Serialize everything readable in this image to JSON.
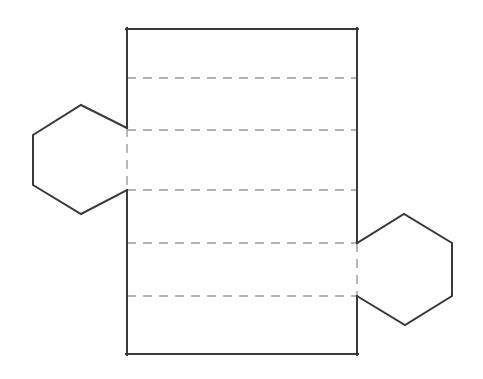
{
  "figure": {
    "title": "Net of a hexagonal prism",
    "description": "Geometric net diagram: a tall rectangle divided into six horizontal bands by five dashed fold lines, with a regular hexagon attached to the left edge and a congruent hexagon attached to the right edge.",
    "canvas": {
      "width": 483,
      "height": 379,
      "background": "#ffffff"
    },
    "colors": {
      "solid_edge": "#3a3a3a",
      "fold_line": "#9a9a9a",
      "face_fill": "#ffffff"
    },
    "stroke_widths": {
      "solid_edge": 2,
      "fold_line": 1.4
    },
    "fold_dash_pattern": "9 7"
  },
  "chart_data": {
    "type": "diagram",
    "title": "Net of a hexagonal prism",
    "shapes": [
      {
        "name": "lateral-surface-rectangle",
        "kind": "rectangle",
        "x": 127,
        "y": 29,
        "width": 230,
        "height": 325,
        "x_left": 127,
        "x_right": 357,
        "y_top": 29,
        "y_bottom": 354,
        "style": "solid",
        "note": "Six lateral faces of the prism laid flat side by side"
      },
      {
        "name": "left-hexagon-base",
        "kind": "hexagon",
        "style": "solid",
        "points": "127,128 81,105 33,135 33,185 81,214 127,190",
        "attach_edge": "rectangle-left",
        "attach_y_top": 128,
        "attach_y_bottom": 190
      },
      {
        "name": "right-hexagon-base",
        "kind": "hexagon",
        "style": "solid",
        "points": "357,243 404,214 452,243 452,296 405,325 357,296",
        "attach_edge": "rectangle-right",
        "attach_y_top": 243,
        "attach_y_bottom": 296
      }
    ],
    "fold_lines": [
      {
        "name": "fold-line-1",
        "orientation": "horizontal",
        "y": 78,
        "x1": 127,
        "x2": 357
      },
      {
        "name": "fold-line-2",
        "orientation": "horizontal",
        "y": 130,
        "x1": 127,
        "x2": 357
      },
      {
        "name": "fold-line-3",
        "orientation": "horizontal",
        "y": 190,
        "x1": 127,
        "x2": 357
      },
      {
        "name": "fold-line-4",
        "orientation": "horizontal",
        "y": 243,
        "x1": 127,
        "x2": 357
      },
      {
        "name": "fold-line-5",
        "orientation": "horizontal",
        "y": 296,
        "x1": 127,
        "x2": 357
      },
      {
        "name": "fold-line-left-attachment",
        "orientation": "vertical",
        "x": 127,
        "y1": 128,
        "y2": 190
      },
      {
        "name": "fold-line-right-attachment",
        "orientation": "vertical",
        "x": 357,
        "y1": 243,
        "y2": 296
      }
    ],
    "solid_edge_segments": [
      {
        "name": "rectangle-top-edge",
        "x1": 127,
        "y1": 29,
        "x2": 357,
        "y2": 29
      },
      {
        "name": "rectangle-bottom-edge",
        "x1": 127,
        "y1": 354,
        "x2": 357,
        "y2": 354
      },
      {
        "name": "rectangle-left-edge-upper",
        "x1": 127,
        "y1": 29,
        "x2": 127,
        "y2": 128
      },
      {
        "name": "rectangle-left-edge-lower",
        "x1": 127,
        "y1": 190,
        "x2": 127,
        "y2": 354
      },
      {
        "name": "rectangle-right-edge-upper",
        "x1": 357,
        "y1": 29,
        "x2": 357,
        "y2": 243
      },
      {
        "name": "rectangle-right-edge-lower",
        "x1": 357,
        "y1": 296,
        "x2": 357,
        "y2": 354
      }
    ],
    "counts": {
      "rectangular_faces": 6,
      "hexagonal_faces": 2,
      "fold_lines": 7
    },
    "labels": [],
    "legend": [],
    "annotations": []
  }
}
